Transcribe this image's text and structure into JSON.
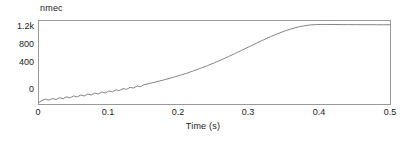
{
  "chart_data": {
    "type": "line",
    "title": "",
    "series_label": "nmec",
    "xlabel": "Time (s)",
    "ylabel": "",
    "xlim": [
      0,
      0.5
    ],
    "ylim": [
      -60,
      1320
    ],
    "grid": false,
    "legend": "none",
    "xticks": [
      "0",
      "0.1",
      "0.2",
      "0.3",
      "0.4",
      "0.5"
    ],
    "xtick_values": [
      0,
      0.1,
      0.2,
      0.3,
      0.4,
      0.5
    ],
    "yticks": [
      "0",
      "400",
      "800",
      "1.2k"
    ],
    "ytick_values": [
      0,
      400,
      800,
      1200
    ],
    "line_color": "#777777",
    "axis_color": "#999999",
    "text_color": "#222222",
    "background": "#ffffff",
    "plateau_value": 1250,
    "series": [
      {
        "name": "nmec",
        "x": [
          0.0,
          0.005,
          0.01,
          0.015,
          0.02,
          0.025,
          0.03,
          0.035,
          0.04,
          0.045,
          0.05,
          0.055,
          0.06,
          0.065,
          0.07,
          0.075,
          0.08,
          0.085,
          0.09,
          0.095,
          0.1,
          0.105,
          0.11,
          0.115,
          0.12,
          0.125,
          0.13,
          0.135,
          0.14,
          0.145,
          0.15,
          0.16,
          0.17,
          0.18,
          0.19,
          0.2,
          0.21,
          0.22,
          0.23,
          0.24,
          0.25,
          0.26,
          0.27,
          0.28,
          0.29,
          0.3,
          0.31,
          0.32,
          0.33,
          0.34,
          0.35,
          0.36,
          0.37,
          0.38,
          0.385,
          0.39,
          0.395,
          0.4,
          0.405,
          0.41,
          0.42,
          0.43,
          0.44,
          0.45,
          0.46,
          0.47,
          0.48,
          0.49,
          0.5
        ],
        "y": [
          -30,
          5,
          28,
          12,
          38,
          22,
          52,
          36,
          66,
          50,
          82,
          64,
          96,
          80,
          112,
          96,
          128,
          112,
          146,
          130,
          164,
          148,
          182,
          168,
          202,
          188,
          222,
          210,
          244,
          232,
          266,
          292,
          320,
          350,
          382,
          416,
          452,
          492,
          534,
          578,
          626,
          676,
          728,
          782,
          838,
          894,
          950,
          1004,
          1056,
          1104,
          1148,
          1186,
          1216,
          1238,
          1245,
          1250,
          1253,
          1255,
          1255,
          1255,
          1254,
          1253,
          1252,
          1252,
          1251,
          1251,
          1250,
          1250,
          1250
        ]
      }
    ]
  }
}
